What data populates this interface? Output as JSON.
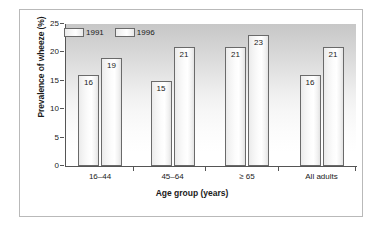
{
  "chart_data": {
    "type": "bar",
    "title": "",
    "subtitle": "",
    "xlabel": "Age group (years)",
    "ylabel": "Prevalence of wheeze (%)",
    "categories": [
      "16–44",
      "45–64",
      "≥ 65",
      "All adults"
    ],
    "series": [
      {
        "name": "1991",
        "values": [
          16,
          15,
          21,
          16
        ]
      },
      {
        "name": "1996",
        "values": [
          19,
          21,
          23,
          21
        ]
      }
    ],
    "ylim": [
      0,
      25
    ],
    "yticks": [
      0,
      5,
      10,
      15,
      20,
      25
    ],
    "ytick_labels": [
      "0",
      "5",
      "10",
      "15",
      "20",
      "25"
    ],
    "grid": false,
    "legend_position": "top-left-inside",
    "data_labels": true,
    "colors": {
      "bar_fill": "#f7f7f7",
      "bar_outline": "#6a6a6a",
      "plot_background_top": "#c7c7c7",
      "plot_background_bottom": "#ffffff",
      "axis": "#555555",
      "text": "#1a1a1a",
      "card_border": "#b9b9b9"
    }
  }
}
